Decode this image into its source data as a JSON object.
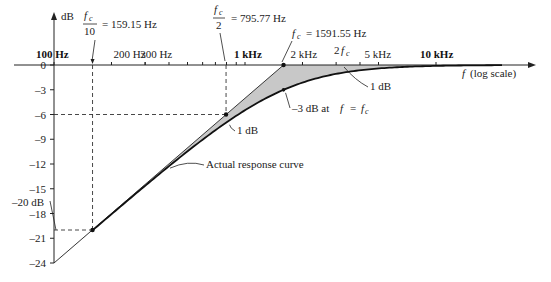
{
  "chart_data": {
    "type": "line",
    "title": "",
    "xlabel": "f (log scale)",
    "ylabel": "dB",
    "xscale": "log",
    "xlim": [
      100,
      15000
    ],
    "ylim": [
      -24,
      0
    ],
    "x_ticks_labeled": [
      {
        "value": 100,
        "label": "100 Hz",
        "bold": true
      },
      {
        "value": 200,
        "label": "200 Hz",
        "bold": false
      },
      {
        "value": 300,
        "label": "300 Hz",
        "bold": false
      },
      {
        "value": 1000,
        "label": "1 kHz",
        "bold": true
      },
      {
        "value": 2000,
        "label": "2 kHz",
        "bold": false
      },
      {
        "value": 5000,
        "label": "5 kHz",
        "bold": false
      },
      {
        "value": 10000,
        "label": "10 kHz",
        "bold": true
      }
    ],
    "x_ticks_minor": [
      200,
      300,
      400,
      500,
      600,
      700,
      800,
      900,
      2000,
      3000,
      4000,
      5000
    ],
    "y_ticks": [
      0,
      -3,
      -6,
      -9,
      -12,
      -15,
      -18,
      -21,
      -24
    ],
    "y_tick_labels": [
      "0",
      "–3",
      "–6",
      "–9",
      "–12",
      "–15",
      "–18",
      "–21",
      "–24"
    ],
    "series": [
      {
        "name": "Bode asymptote",
        "x": [
          100,
          159.15,
          795.77,
          1591.55,
          15000
        ],
        "y": [
          -24,
          -20,
          -6,
          0,
          0
        ]
      },
      {
        "name": "Actual response curve",
        "x": [
          159.15,
          318.3,
          795.77,
          1591.55,
          3183.1,
          5000,
          10000,
          15000
        ],
        "y": [
          -20.04,
          -14.2,
          -7.0,
          -3.0,
          -1.0,
          -0.5,
          -0.1,
          0
        ]
      }
    ],
    "key_points": [
      {
        "label_num": "f_c",
        "label_den": "10",
        "value": "= 159.15 Hz",
        "x": 159.15,
        "y": -20
      },
      {
        "label_num": "f_c",
        "label_den": "2",
        "value": "= 795.77 Hz",
        "x": 795.77,
        "y": -6
      },
      {
        "label": "f_c",
        "value": "= 1591.55 Hz",
        "x": 1591.55,
        "y": 0
      }
    ],
    "annotations": [
      {
        "text": "–20 dB",
        "x": 100,
        "y": -20
      },
      {
        "text": "1 dB",
        "near_x": 795.77,
        "near_y": -7
      },
      {
        "text": "1 dB",
        "near_x": 3183.1,
        "near_y": -1
      },
      {
        "text": "–3 dB at f = f_c",
        "near_x": 1591.55,
        "near_y": -3
      },
      {
        "text": "Actual response curve",
        "near_x": 400,
        "near_y": -12
      },
      {
        "text": "2 f_c",
        "x": 3183.1,
        "y": 0
      }
    ],
    "fill_between": {
      "color": "#c8c8c8",
      "description": "shaded area between asymptote and actual curve"
    },
    "grid": false,
    "legend": null
  },
  "labels": {
    "y_axis": "dB",
    "x_axis": "f (log scale)",
    "fc10_num": "f",
    "fc10_sub": "c",
    "fc10_den": "10",
    "fc10_value": "=  159.15 Hz",
    "fc2_num": "f",
    "fc2_sub": "c",
    "fc2_den": "2",
    "fc2_value": "=  795.77 Hz",
    "fc_f": "f",
    "fc_sub": "c",
    "fc_value": "=  1591.55 Hz",
    "two_fc_2": "2",
    "two_fc_f": "f",
    "two_fc_sub": "c",
    "minus20": "–20 dB",
    "one_db_a": "1 dB",
    "one_db_b": "1 dB",
    "minus3_text": "–3 dB at",
    "minus3_f": "f",
    "minus3_eq": "=",
    "minus3_fc": "f",
    "minus3_fc_sub": "c",
    "actual_curve": "Actual response curve"
  },
  "colors": {
    "axis": "#222222",
    "fill": "#c8c8c8",
    "curve": "#111111"
  }
}
